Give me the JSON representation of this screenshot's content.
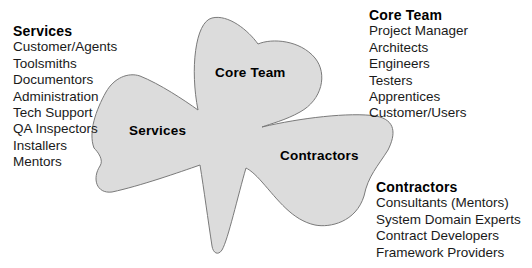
{
  "diagram": {
    "shape": "shamrock",
    "fill_color": "#dcdcdc",
    "stroke_color": "#7a7a7a",
    "lobes": [
      {
        "label": "Core Team"
      },
      {
        "label": "Services"
      },
      {
        "label": "Contractors"
      }
    ],
    "groups": {
      "services": {
        "title": "Services",
        "items": [
          "Customer/Agents",
          "Toolsmiths",
          "Documentors",
          "Administration",
          "Tech Support",
          "QA Inspectors",
          "Installers",
          "Mentors"
        ]
      },
      "core_team": {
        "title": "Core Team",
        "items": [
          "Project Manager",
          "Architects",
          "Engineers",
          "Testers",
          "Apprentices",
          "Customer/Users"
        ]
      },
      "contractors": {
        "title": "Contractors",
        "items": [
          "Consultants (Mentors)",
          "System Domain Experts",
          "Contract Developers",
          "Framework Providers"
        ]
      }
    }
  }
}
